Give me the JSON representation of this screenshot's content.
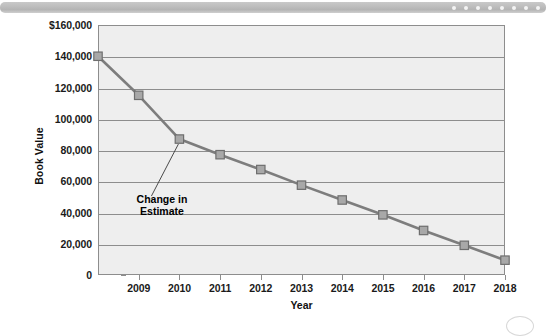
{
  "decoration": {
    "top_bar_dot_count": 8,
    "bar_color": "#bcbcbc",
    "dot_color": "#f4f4f4"
  },
  "chart_data": {
    "type": "line",
    "title": "",
    "xlabel": "Year",
    "ylabel": "Book Value",
    "categories": [
      "",
      "2009",
      "2010",
      "2011",
      "2012",
      "2013",
      "2014",
      "2015",
      "2016",
      "2017",
      "2018"
    ],
    "x_tick_labels": [
      "2009",
      "2010",
      "2011",
      "2012",
      "2013",
      "2014",
      "2015",
      "2016",
      "2017",
      "2018"
    ],
    "values": [
      140000,
      115000,
      87000,
      77000,
      67500,
      57500,
      48000,
      38500,
      28500,
      19000,
      9500
    ],
    "ylim": [
      0,
      160000
    ],
    "y_tick_labels": [
      "$160,000",
      "140,000",
      "120,000",
      "100,000",
      "80,000",
      "60,000",
      "40,000",
      "20,000",
      "0"
    ],
    "y_tick_values": [
      160000,
      140000,
      120000,
      100000,
      80000,
      60000,
      40000,
      20000,
      0
    ],
    "grid": true,
    "legend": "none",
    "series_color": "#7d7d7d",
    "marker_color": "#a8a8a8",
    "marker_edge_color": "#6e6e6e",
    "plot_background": "#eeeeee",
    "axis_color": "#8d8d8d",
    "annotations": [
      {
        "text_line1": "Change in",
        "text_line2": "Estimate",
        "points_at_category": "2010",
        "points_at_value": 87000
      }
    ]
  }
}
